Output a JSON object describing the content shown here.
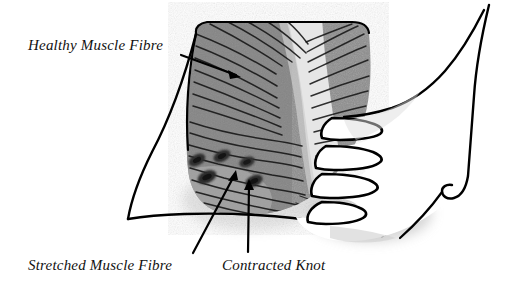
{
  "figure": {
    "width": 517,
    "height": 281,
    "background": "#ffffff"
  },
  "labels": [
    {
      "id": "healthy-muscle-fibre",
      "text": "Healthy Muscle Fibre",
      "x": 28,
      "y": 50,
      "leader": {
        "type": "arrow",
        "from_x": 181,
        "from_y": 55,
        "to_x": 240,
        "to_y": 77
      }
    },
    {
      "id": "stretched-muscle-fibre",
      "text": "Stretched Muscle Fibre",
      "x": 28,
      "y": 270,
      "leader": {
        "type": "arrow",
        "from_x": 193,
        "from_y": 253,
        "to_x": 232,
        "to_y": 172
      }
    },
    {
      "id": "contracted-knot",
      "text": "Contracted Knot",
      "x": 222,
      "y": 270,
      "leader": {
        "type": "arrow",
        "from_x": 248,
        "from_y": 252,
        "to_x": 249,
        "to_y": 182
      }
    }
  ],
  "colors": {
    "muscle_fill": "#8d8d8d",
    "muscle_fill_dark": "#7d7d7d",
    "tendon_light": "#e3e3e3",
    "tendon_mid": "#cfcfcf",
    "knot_dark": "#2b2b2b",
    "hand_fill": "#ffffff",
    "shadow": "#b9b9b9",
    "outline": "#000000",
    "text": "#111111"
  },
  "anatomy": {
    "muscle_label": "muscle belly with diagonal fibre striations",
    "tendon_label": "central light tendon band",
    "knots": [
      {
        "cx": 197,
        "cy": 160,
        "rx": 9,
        "ry": 5.5,
        "angle": -28
      },
      {
        "cx": 222,
        "cy": 156,
        "rx": 9,
        "ry": 5.5,
        "angle": -25
      },
      {
        "cx": 247,
        "cy": 162,
        "rx": 8,
        "ry": 5,
        "angle": -22
      },
      {
        "cx": 207,
        "cy": 176,
        "rx": 10,
        "ry": 6,
        "angle": -25
      },
      {
        "cx": 253,
        "cy": 181,
        "rx": 9,
        "ry": 5.5,
        "angle": -24
      }
    ],
    "hand_label": "hand pressing into muscle from the right",
    "fingers_count": 4,
    "thumb_label": "thumb"
  }
}
